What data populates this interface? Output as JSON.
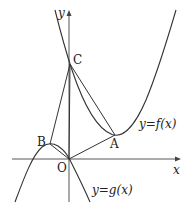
{
  "diagram": {
    "type": "function-graph",
    "axes": {
      "x_label": "x",
      "y_label": "y",
      "origin_label": "O"
    },
    "points": [
      {
        "name": "A",
        "label": "A",
        "px": [
          115,
          135
        ]
      },
      {
        "name": "B",
        "label": "B",
        "px": [
          50,
          144
        ]
      },
      {
        "name": "C",
        "label": "C",
        "px": [
          70,
          64
        ]
      },
      {
        "name": "O",
        "label": "O",
        "px": [
          69,
          159
        ]
      }
    ],
    "curves": [
      {
        "name": "f",
        "label": "y=f(x)"
      },
      {
        "name": "g",
        "label": "y=g(x)"
      }
    ],
    "segments": [
      "OC",
      "BC",
      "CA",
      "OA",
      "BO"
    ],
    "colors": {
      "stroke": "#333333",
      "background": "#ffffff"
    }
  }
}
